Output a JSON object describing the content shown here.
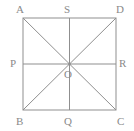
{
  "figure": {
    "kind": "geometry-diagram",
    "stroke_color": "#8f8f8f",
    "label_color": "#8a8a8a",
    "background_color": "#ffffff",
    "stroke_width": 1,
    "square": {
      "left": 23,
      "top": 18,
      "right": 116,
      "bottom": 110
    },
    "center": {
      "x": 69.5,
      "y": 64
    },
    "labels": {
      "top_left": "A",
      "top_mid": "S",
      "top_right": "D",
      "left_mid": "P",
      "center": "O",
      "right_mid": "R",
      "bottom_left": "B",
      "bottom_mid": "Q",
      "bottom_right": "C"
    },
    "segments": [
      {
        "name": "side-top",
        "from": "A",
        "to": "D"
      },
      {
        "name": "side-right",
        "from": "D",
        "to": "C"
      },
      {
        "name": "side-bottom",
        "from": "B",
        "to": "C"
      },
      {
        "name": "side-left",
        "from": "A",
        "to": "B"
      },
      {
        "name": "diagonal-A-C",
        "from": "A",
        "to": "C"
      },
      {
        "name": "diagonal-B-D",
        "from": "B",
        "to": "D"
      },
      {
        "name": "midline-vertical",
        "from": "S",
        "to": "Q"
      },
      {
        "name": "midline-horizontal",
        "from": "P",
        "to": "R"
      }
    ]
  }
}
